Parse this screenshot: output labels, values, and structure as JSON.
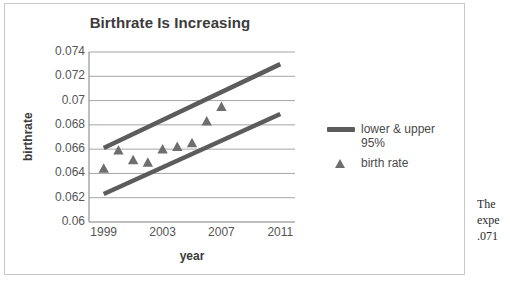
{
  "chart_data": {
    "type": "scatter",
    "title": "Birthrate Is Increasing",
    "xlabel": "year",
    "ylabel": "birthrate",
    "xlim": [
      1998,
      2012
    ],
    "ylim": [
      0.06,
      0.074
    ],
    "xticks": [
      "1999",
      "2003",
      "2007",
      "2011"
    ],
    "xtick_values": [
      1999,
      2003,
      2007,
      2011
    ],
    "yticks": [
      "0.06",
      "0.062",
      "0.064",
      "0.066",
      "0.068",
      "0.07",
      "0.072",
      "0.074"
    ],
    "ytick_values": [
      0.06,
      0.062,
      0.064,
      0.066,
      0.068,
      0.07,
      0.072,
      0.074
    ],
    "grid": "horizontal",
    "legend_position": "right",
    "series": [
      {
        "name": "birth rate",
        "type": "scatter",
        "marker": "triangle",
        "color": "#6e6e6e",
        "x": [
          1999,
          2000,
          2001,
          2002,
          2003,
          2004,
          2005,
          2006,
          2007
        ],
        "values": [
          0.0644,
          0.0659,
          0.0651,
          0.0649,
          0.066,
          0.0662,
          0.0665,
          0.0683,
          0.0695
        ]
      },
      {
        "name": "upper 95%",
        "type": "line",
        "color": "#5c5c5c",
        "x": [
          1999,
          2011
        ],
        "values": [
          0.0661,
          0.073
        ]
      },
      {
        "name": "lower 95%",
        "type": "line",
        "color": "#5c5c5c",
        "x": [
          1999,
          2011
        ],
        "values": [
          0.0623,
          0.0689
        ]
      }
    ],
    "legend": [
      {
        "label": "lower & upper 95%",
        "marker": "line",
        "color": "#5c5c5c"
      },
      {
        "label": "birth rate",
        "marker": "triangle",
        "color": "#6e6e6e"
      }
    ]
  },
  "side_text": {
    "line1": "The",
    "line2": "expe",
    "line3": ".071"
  },
  "colors": {
    "line": "#5c5c5c",
    "marker": "#6e6e6e",
    "grid": "#a6a6a6",
    "axis": "#7f7f7f",
    "text": "#555555",
    "title": "#3b3b3b",
    "frame": "#c9c9c9"
  }
}
